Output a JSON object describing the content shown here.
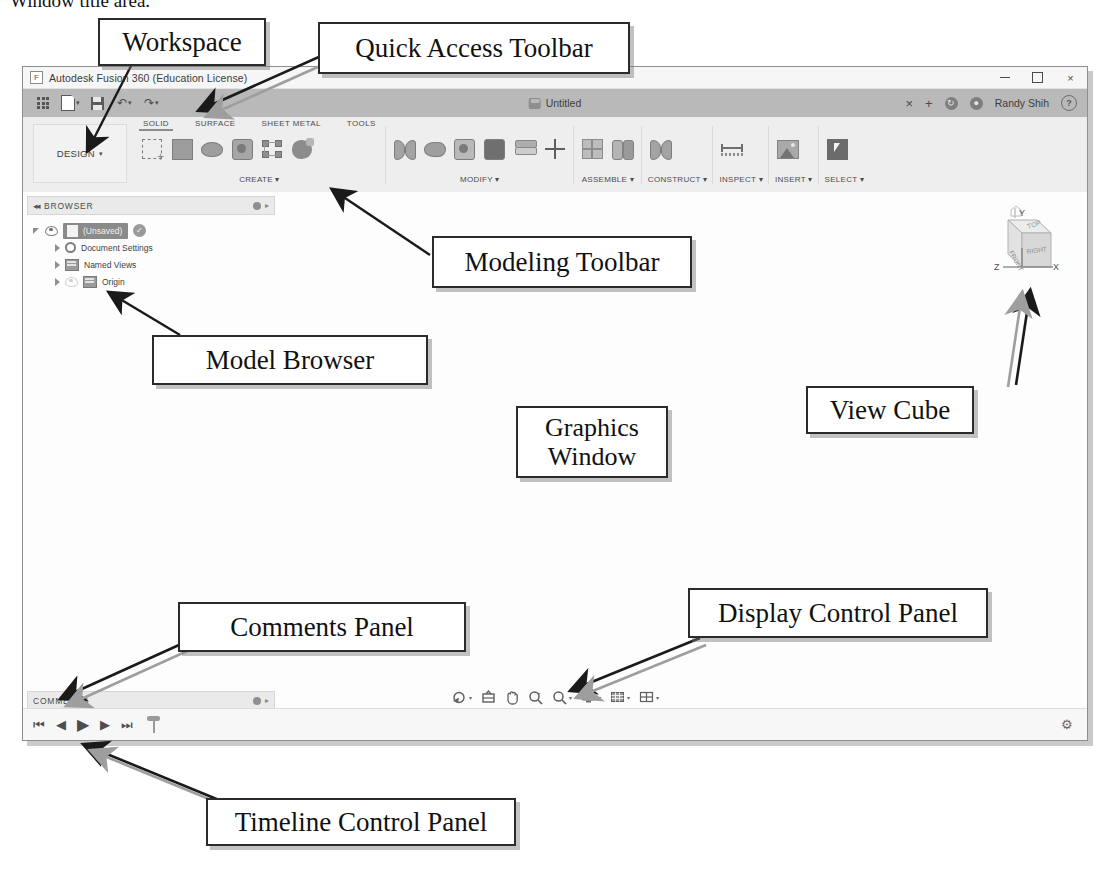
{
  "page": {
    "cut_heading": "Window title area."
  },
  "callouts": [
    {
      "id": "workspace",
      "label": "Workspace"
    },
    {
      "id": "quick-access-toolbar",
      "label": "Quick Access Toolbar"
    },
    {
      "id": "modeling-toolbar",
      "label": "Modeling Toolbar"
    },
    {
      "id": "model-browser",
      "label": "Model Browser"
    },
    {
      "id": "graphics-window",
      "label": "Graphics\nWindow"
    },
    {
      "id": "graphics-window-l1",
      "label": "Graphics"
    },
    {
      "id": "graphics-window-l2",
      "label": "Window"
    },
    {
      "id": "view-cube",
      "label": "View Cube"
    },
    {
      "id": "display-control-panel",
      "label": "Display Control Panel"
    },
    {
      "id": "comments-panel",
      "label": "Comments Panel"
    },
    {
      "id": "timeline-control-panel",
      "label": "Timeline Control Panel"
    }
  ],
  "window": {
    "title": "Autodesk Fusion 360 (Education License)",
    "app_icon": "F",
    "controls": {
      "minimize": "minimize-icon",
      "maximize": "maximize-icon",
      "close": "×"
    }
  },
  "quick_access": {
    "buttons": [
      {
        "name": "app-grid-icon",
        "label": ""
      },
      {
        "name": "new-document-icon",
        "label": "",
        "has_caret": true
      },
      {
        "name": "save-icon",
        "label": ""
      },
      {
        "name": "undo-icon",
        "label": "↶",
        "has_caret": true
      },
      {
        "name": "redo-icon",
        "label": "↷",
        "has_caret": true
      }
    ],
    "document_tab": "Untitled",
    "tab_close": "×",
    "new_tab": "+",
    "job_status_icon": "job-status-icon",
    "notifications_icon": "notifications-icon",
    "user_name": "Randy Shih",
    "help_icon": "?"
  },
  "ribbon": {
    "workspace_label": "DESIGN",
    "workspace_caret": "▾",
    "tabs": [
      {
        "label": "SOLID",
        "active": true
      },
      {
        "label": "SURFACE",
        "active": false
      },
      {
        "label": "SHEET METAL",
        "active": false
      },
      {
        "label": "TOOLS",
        "active": false
      }
    ],
    "groups": [
      {
        "label": "CREATE ▾",
        "icons": [
          "sketch-create-icon",
          "extrude-icon",
          "loft-icon",
          "revolve-icon",
          "pattern-nodes-icon",
          "sculpt-form-icon"
        ]
      },
      {
        "label": "MODIFY ▾",
        "icons": [
          "press-pull-icon",
          "fillet-icon",
          "shell-icon",
          "combine-icon",
          "split-icon",
          "move-copy-icon"
        ]
      },
      {
        "label": "ASSEMBLE ▾",
        "icons": [
          "new-component-icon",
          "joint-icon"
        ]
      },
      {
        "label": "CONSTRUCT ▾",
        "icons": [
          "offset-plane-icon"
        ]
      },
      {
        "label": "INSPECT ▾",
        "icons": [
          "measure-icon"
        ]
      },
      {
        "label": "INSERT ▾",
        "icons": [
          "insert-image-icon"
        ]
      },
      {
        "label": "SELECT ▾",
        "icons": [
          "select-cursor-icon"
        ]
      }
    ]
  },
  "browser": {
    "header": "BROWSER",
    "collapse_icon": "◂◂",
    "tree": [
      {
        "label": "(Unsaved)",
        "level": 1,
        "icon": "document-icon",
        "badge": "check-badge-icon",
        "expanded": true,
        "visible": true
      },
      {
        "label": "Document Settings",
        "level": 2,
        "icon": "gear-icon"
      },
      {
        "label": "Named Views",
        "level": 2,
        "icon": "folder-icon"
      },
      {
        "label": "Origin",
        "level": 2,
        "icon": "folder-icon"
      }
    ]
  },
  "view_cube": {
    "faces": {
      "top": "TOP",
      "front": "FRONT",
      "right": "RIGHT"
    },
    "axes": {
      "x": "X",
      "y": "Y",
      "z": "Z"
    }
  },
  "comments": {
    "header": "COMMENTS"
  },
  "display_control": {
    "items": [
      {
        "name": "orbit-icon",
        "caret": true
      },
      {
        "name": "look-at-icon",
        "caret": false
      },
      {
        "name": "pan-icon",
        "caret": false
      },
      {
        "name": "zoom-window-icon",
        "caret": false
      },
      {
        "name": "zoom-icon",
        "caret": true
      },
      {
        "name": "display-settings-icon",
        "caret": true
      },
      {
        "name": "grid-snap-icon",
        "caret": true
      },
      {
        "name": "viewports-icon",
        "caret": true
      }
    ]
  },
  "timeline": {
    "buttons": [
      {
        "name": "go-to-beginning-button",
        "glyph": "⏮"
      },
      {
        "name": "step-back-button",
        "glyph": "◀"
      },
      {
        "name": "play-button",
        "glyph": "▶"
      },
      {
        "name": "step-forward-button",
        "glyph": "▶"
      },
      {
        "name": "go-to-end-button",
        "glyph": "⏭"
      },
      {
        "name": "timeline-marker",
        "glyph": ""
      }
    ],
    "settings_icon": "⚙"
  },
  "colors": {
    "window_bg": "#f1f1f1",
    "qat_bar": "#b9b9b9",
    "ribbon": "#eeeeee",
    "panel_head": "#eaeaea",
    "canvas": "#fdfdfd",
    "callout_border": "#2b2b2b"
  }
}
